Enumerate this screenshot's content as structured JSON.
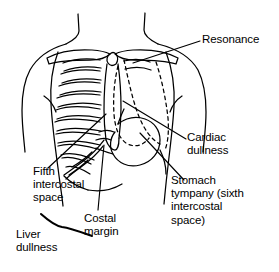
{
  "figure": {
    "background_color": "#ffffff",
    "line_color": "#000000",
    "width": 279,
    "height": 272
  },
  "labels": {
    "resonance": "Resonance",
    "cardiac_dullness": "Cardiac\ndullness",
    "stomach_tympany": "Stomach\ntympany (sixth\nintercostal\nspace)",
    "fifth_intercostal_space": "Fifth\nintercostal\nspace",
    "costal_margin": "Costal\nmargin",
    "liver_dullness": "Liver\ndullness"
  },
  "anatomy": {
    "structures": [
      "neck",
      "shoulders",
      "left-clavicle",
      "right-clavicle",
      "sternum",
      "rib-cage",
      "costal-margin",
      "stomach",
      "heart-border-dashed",
      "lung-border-dashed",
      "torso-outline"
    ],
    "rib_pairs_drawn": 10
  },
  "leader_lines": [
    {
      "name": "resonance-leader",
      "from": [
        200,
        41
      ],
      "to": [
        133,
        63
      ]
    },
    {
      "name": "cardiac-dullness-leader",
      "from": [
        186,
        139
      ],
      "to": [
        123,
        101
      ]
    },
    {
      "name": "stomach-tympany-leader",
      "from": [
        184,
        180
      ],
      "to": [
        140,
        133
      ]
    },
    {
      "name": "fifth-intercostal-leader",
      "from": [
        48,
        168
      ],
      "to": [
        106,
        114
      ]
    },
    {
      "name": "costal-margin-leader",
      "from": [
        98,
        210
      ],
      "to": [
        104,
        145
      ]
    },
    {
      "name": "liver-dullness-wave",
      "from": [
        42,
        215
      ],
      "to": [
        92,
        233
      ]
    }
  ]
}
